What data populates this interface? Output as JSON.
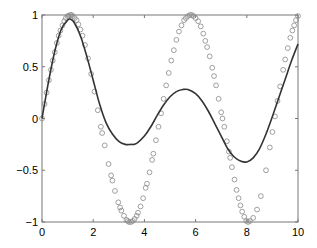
{
  "chart_data": {
    "type": "line",
    "title": "",
    "xlabel": "",
    "ylabel": "",
    "xlim": [
      0,
      10
    ],
    "ylim": [
      -1,
      1
    ],
    "grid": false,
    "legend": null,
    "x_ticks": [
      0,
      2,
      4,
      6,
      8,
      10
    ],
    "y_ticks": [
      -1,
      -0.5,
      0,
      0.5,
      1
    ],
    "x_tick_labels": [
      "0",
      "2",
      "4",
      "6",
      "8",
      "10"
    ],
    "y_tick_labels": [
      "−1",
      "−0.5",
      "0",
      "0.5",
      "1"
    ],
    "series": [
      {
        "name": "fit",
        "style": "solid-line",
        "color": "#333333",
        "x": [
          0,
          0.25,
          0.5,
          0.75,
          1.0,
          1.1,
          1.25,
          1.5,
          1.75,
          2.0,
          2.25,
          2.5,
          2.75,
          3.0,
          3.25,
          3.5,
          3.6,
          3.75,
          4.0,
          4.25,
          4.5,
          4.75,
          5.0,
          5.25,
          5.5,
          5.7,
          6.0,
          6.25,
          6.5,
          6.75,
          7.0,
          7.25,
          7.5,
          7.75,
          8.0,
          8.25,
          8.5,
          8.75,
          9.0,
          9.25,
          9.5,
          9.75,
          10.0
        ],
        "values": [
          0,
          0.35,
          0.65,
          0.86,
          0.95,
          0.96,
          0.93,
          0.8,
          0.6,
          0.37,
          0.14,
          -0.04,
          -0.15,
          -0.22,
          -0.25,
          -0.25,
          -0.25,
          -0.23,
          -0.17,
          -0.08,
          0.03,
          0.13,
          0.21,
          0.26,
          0.28,
          0.28,
          0.24,
          0.17,
          0.07,
          -0.05,
          -0.17,
          -0.29,
          -0.37,
          -0.41,
          -0.42,
          -0.38,
          -0.29,
          -0.15,
          0.02,
          0.2,
          0.38,
          0.56,
          0.72
        ]
      },
      {
        "name": "data",
        "style": "circle-markers",
        "color": "#888888",
        "x": [
          0,
          0.1,
          0.18,
          0.27,
          0.35,
          0.42,
          0.5,
          0.58,
          0.65,
          0.72,
          0.8,
          0.87,
          0.93,
          1.0,
          1.05,
          1.1,
          1.15,
          1.2,
          1.28,
          1.35,
          1.42,
          1.5,
          1.58,
          1.68,
          1.8,
          1.92,
          2.05,
          2.18,
          2.3,
          2.35,
          2.45,
          2.6,
          2.7,
          2.75,
          2.85,
          2.98,
          3.05,
          3.1,
          3.2,
          3.3,
          3.35,
          3.4,
          3.48,
          3.55,
          3.62,
          3.7,
          3.75,
          3.85,
          3.95,
          4.05,
          4.1,
          4.2,
          4.3,
          4.35,
          4.45,
          4.55,
          4.65,
          4.75,
          4.85,
          4.95,
          5.05,
          5.15,
          5.25,
          5.35,
          5.45,
          5.55,
          5.62,
          5.7,
          5.78,
          5.85,
          5.92,
          6.0,
          6.1,
          6.2,
          6.3,
          6.38,
          6.45,
          6.55,
          6.65,
          6.72,
          6.8,
          6.9,
          7.0,
          7.05,
          7.12,
          7.22,
          7.3,
          7.35,
          7.42,
          7.52,
          7.6,
          7.68,
          7.75,
          7.82,
          7.9,
          7.98,
          8.05,
          8.12,
          8.25,
          8.4,
          8.55,
          8.75,
          8.9,
          9.0,
          9.1,
          9.2,
          9.3,
          9.42,
          9.5,
          9.6,
          9.7,
          9.78,
          9.85,
          9.92,
          10.0
        ],
        "values": [
          0,
          0.14,
          0.25,
          0.37,
          0.47,
          0.56,
          0.64,
          0.73,
          0.8,
          0.85,
          0.9,
          0.94,
          0.97,
          0.99,
          0.99,
          1.0,
          1.0,
          0.99,
          0.97,
          0.95,
          0.91,
          0.86,
          0.8,
          0.71,
          0.58,
          0.43,
          0.26,
          0.08,
          -0.08,
          -0.14,
          -0.26,
          -0.44,
          -0.55,
          -0.6,
          -0.7,
          -0.81,
          -0.86,
          -0.89,
          -0.94,
          -0.98,
          -0.99,
          -1.0,
          -1.0,
          -0.99,
          -0.97,
          -0.94,
          -0.91,
          -0.85,
          -0.77,
          -0.67,
          -0.63,
          -0.52,
          -0.4,
          -0.34,
          -0.21,
          -0.08,
          0.05,
          0.19,
          0.32,
          0.44,
          0.56,
          0.66,
          0.76,
          0.84,
          0.9,
          0.95,
          0.97,
          0.99,
          1.0,
          1.0,
          0.99,
          0.97,
          0.94,
          0.89,
          0.82,
          0.75,
          0.69,
          0.6,
          0.49,
          0.41,
          0.32,
          0.19,
          0.06,
          0.0,
          -0.08,
          -0.22,
          -0.32,
          -0.38,
          -0.47,
          -0.59,
          -0.69,
          -0.77,
          -0.84,
          -0.9,
          -0.95,
          -0.99,
          -1.0,
          -0.99,
          -0.96,
          -0.88,
          -0.75,
          -0.5,
          -0.28,
          -0.13,
          0.02,
          0.17,
          0.31,
          0.47,
          0.57,
          0.68,
          0.78,
          0.85,
          0.9,
          0.95,
          0.99
        ]
      }
    ]
  }
}
